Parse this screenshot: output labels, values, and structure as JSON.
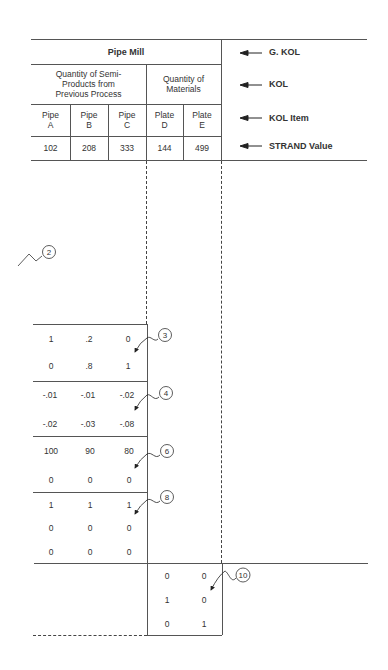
{
  "table": {
    "g_kol": "Pipe Mill",
    "kol": [
      {
        "label": "Quantity of Semi-\nProducts from\nPrevious Process"
      },
      {
        "label": "Quantity of\nMaterials"
      }
    ],
    "items": [
      "Pipe\nA",
      "Pipe\nB",
      "Pipe\nC",
      "Plate\nD",
      "Plate\nE"
    ],
    "strand_values": [
      "102",
      "208",
      "333",
      "144",
      "499"
    ]
  },
  "legend": [
    {
      "label": "G. KOL",
      "icon": "arrow-left-icon"
    },
    {
      "label": "KOL",
      "icon": "arrow-left-icon"
    },
    {
      "label": "KOL Item",
      "icon": "arrow-left-icon"
    },
    {
      "label": "STRAND Value",
      "icon": "arrow-left-icon"
    }
  ],
  "matrix_blocks": [
    {
      "callout": "3",
      "rows": [
        [
          "1",
          ".2",
          "0"
        ],
        [
          "0",
          ".8",
          "1"
        ]
      ]
    },
    {
      "callout": "4",
      "rows": [
        [
          "-.01",
          "-.01",
          "-.02"
        ],
        [
          "-.02",
          "-.03",
          "-.08"
        ]
      ]
    },
    {
      "callout": "6",
      "rows": [
        [
          "100",
          "90",
          "80"
        ],
        [
          "0",
          "0",
          "0"
        ]
      ]
    },
    {
      "callout": "8",
      "rows": [
        [
          "1",
          "1",
          "1"
        ],
        [
          "0",
          "0",
          "0"
        ],
        [
          "0",
          "0",
          "0"
        ]
      ]
    }
  ],
  "materials_block": {
    "callout": "10",
    "rows": [
      [
        "0",
        "0"
      ],
      [
        "1",
        "0"
      ],
      [
        "0",
        "1"
      ]
    ]
  },
  "callout_2": "2"
}
